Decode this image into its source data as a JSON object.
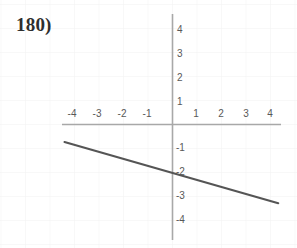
{
  "problem": {
    "number_label": "180)"
  },
  "colors": {
    "background": "#ffffff",
    "axis": "#a8a8a8",
    "grid": "#f1f1f1",
    "line": "#555555",
    "tick_text": "#585858",
    "number_text": "#2e2e2e"
  },
  "chart_data": {
    "type": "line",
    "title": "",
    "xlabel": "",
    "ylabel": "",
    "xlim": [
      -4.8,
      4.8
    ],
    "ylim": [
      -4.8,
      4.8
    ],
    "grid": true,
    "legend": "none",
    "x_ticks": [
      -4,
      -3,
      -2,
      -1,
      1,
      2,
      3,
      4
    ],
    "y_ticks": [
      4,
      3,
      2,
      1,
      -1,
      -2,
      -3,
      -4
    ],
    "x_tick_labels": [
      "-4",
      "-3",
      "-2",
      "-1",
      "1",
      "2",
      "3",
      "4"
    ],
    "y_tick_labels": [
      "4",
      "3",
      "2",
      "1",
      "-1",
      "-2",
      "-3",
      "-4"
    ],
    "series": [
      {
        "name": "line",
        "equation": "y = -0.29x - 2",
        "slope": -0.29,
        "intercept": -2,
        "x": [
          -4.3,
          0,
          4.25
        ],
        "values": [
          -0.75,
          -2,
          -3.3
        ]
      }
    ],
    "annotations": [
      "180)"
    ]
  },
  "axes": {
    "origin_px": [
      172,
      124
    ],
    "unit_px_x": 25,
    "unit_px_y": 24,
    "x_axis_span_px": [
      62,
      281
    ],
    "y_axis_span_px": [
      14,
      240
    ]
  },
  "x_tick_items": [
    {
      "label": "-4",
      "x": -4
    },
    {
      "label": "-3",
      "x": -3
    },
    {
      "label": "-2",
      "x": -2
    },
    {
      "label": "-1",
      "x": -1
    },
    {
      "label": "1",
      "x": 1
    },
    {
      "label": "2",
      "x": 2
    },
    {
      "label": "3",
      "x": 3
    },
    {
      "label": "4",
      "x": 4
    }
  ],
  "y_tick_items": [
    {
      "label": "4",
      "y": 4
    },
    {
      "label": "3",
      "y": 3
    },
    {
      "label": "2",
      "y": 2
    },
    {
      "label": "1",
      "y": 1
    },
    {
      "label": "-1",
      "y": -1
    },
    {
      "label": "-2",
      "y": -2
    },
    {
      "label": "-3",
      "y": -3
    },
    {
      "label": "-4",
      "y": -4
    }
  ]
}
